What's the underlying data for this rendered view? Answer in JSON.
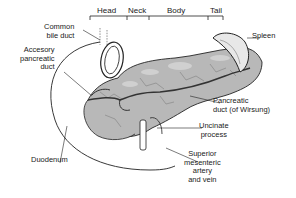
{
  "diagram": {
    "regions": [
      {
        "id": "head",
        "label": "Head"
      },
      {
        "id": "neck",
        "label": "Neck"
      },
      {
        "id": "body",
        "label": "Body"
      },
      {
        "id": "tail",
        "label": "Tail"
      }
    ],
    "labels": {
      "common_bile_duct": [
        "Common",
        "bile duct"
      ],
      "accessory_duct": [
        "Accesory",
        "pancreatic",
        "duct"
      ],
      "duodenum": "Duodenum",
      "spleen": "Spleen",
      "pancreatic_duct": [
        "Pancreatic",
        "duct (of Wirsung)"
      ],
      "uncinate": [
        "Uncinate",
        "process"
      ],
      "sma": [
        "Superior",
        "mesenteric",
        "artery",
        "and vein"
      ]
    },
    "colors": {
      "line": "#222222",
      "pancreas_fill": "#b8b8b8",
      "pancreas_light": "#d4d4d4",
      "duct": "#555555",
      "background": "#ffffff"
    }
  }
}
